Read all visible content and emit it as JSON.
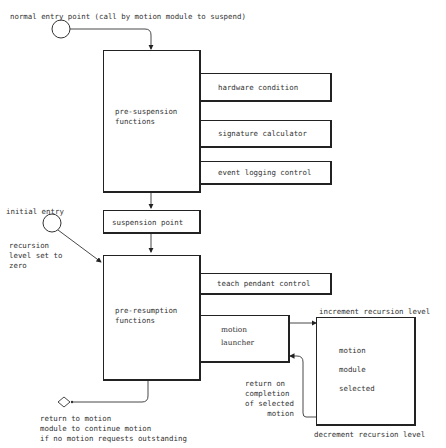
{
  "diagram": {
    "entry_points": {
      "normal": "normal entry point (call by motion module to suspend)",
      "initial": "initial entry",
      "initial_note": "recursion\nlevel set to\nzero"
    },
    "boxes": {
      "pre_suspension": "pre-suspension\nfunctions",
      "hardware_condition": "hardware condition",
      "signature_calculator": "signature calculator",
      "event_logging_control": "event logging control",
      "suspension_point": "suspension point",
      "pre_resumption": "pre-resumption\nfunctions",
      "teach_pendant_control": "teach pendant control",
      "motion_launcher": "motion\nlauncher",
      "motion_module_line1": "motion",
      "motion_module_line2": "module",
      "motion_module_line3": "selected"
    },
    "annotations": {
      "increment": "increment recursion level",
      "decrement": "decrement recursion level",
      "return_on_completion": "return on\ncompletion\nof selected\n     motion",
      "return_to_motion": "return to motion\nmodule to continue motion\nif no motion requests outstanding"
    }
  }
}
